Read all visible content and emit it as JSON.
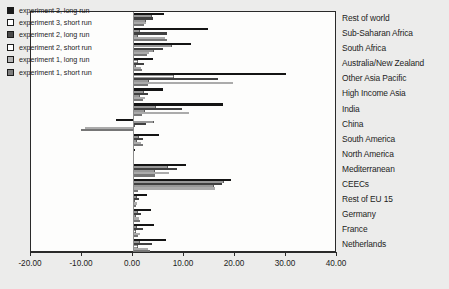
{
  "chart_data": {
    "type": "bar",
    "orientation": "horizontal",
    "title": "",
    "xlabel": "",
    "ylabel": "",
    "xlim": [
      -20.0,
      40.0
    ],
    "xticks": [
      -20.0,
      -10.0,
      0.0,
      10.0,
      20.0,
      30.0,
      40.0
    ],
    "xtick_labels": [
      "-20.00",
      "-10.00",
      "0.00",
      "10.00",
      "20.00",
      "30.00",
      "40.00"
    ],
    "grid": false,
    "legend_position": "top-left-inside",
    "categories": [
      "Rest of world",
      "Sub-Saharan Africa",
      "South Africa",
      "Australia/New Zealand",
      "Other Asia Pacific",
      "High Income Asia",
      "India",
      "China",
      "South America",
      "North America",
      "Mediterranean",
      "CEECs",
      "Rest of EU 15",
      "Germany",
      "France",
      "Netherlands"
    ],
    "series": [
      {
        "name": "experiment 3, long run",
        "color": "#141414",
        "values": [
          6.0,
          14.8,
          11.4,
          4.0,
          30.0,
          5.8,
          17.6,
          -3.4,
          5.0,
          0.4,
          10.4,
          19.2,
          2.8,
          3.6,
          4.1,
          6.5
        ]
      },
      {
        "name": "experiment 3, short run",
        "color": "#ffffff",
        "values": [
          3.8,
          1.4,
          7.6,
          0.9,
          8.0,
          2.1,
          4.6,
          4.2,
          1.2,
          0.2,
          6.9,
          17.8,
          0.7,
          1.0,
          0.8,
          1.4
        ]
      },
      {
        "name": "experiment 2, long run",
        "color": "#404040",
        "values": [
          3.9,
          6.6,
          5.8,
          2.2,
          16.6,
          2.9,
          9.6,
          2.5,
          1.9,
          0.1,
          8.6,
          17.4,
          1.1,
          1.5,
          2.0,
          3.8
        ]
      },
      {
        "name": "experiment 2, short run",
        "color": "#ffffff",
        "values": [
          2.6,
          1.0,
          4.1,
          0.5,
          3.1,
          1.4,
          2.4,
          0.4,
          0.8,
          0.1,
          4.3,
          15.9,
          0.4,
          0.6,
          0.5,
          0.9
        ]
      },
      {
        "name": "experiment 1, long run",
        "color": "#ababab",
        "values": [
          2.5,
          6.3,
          3.1,
          1.6,
          19.6,
          2.4,
          11.0,
          -9.4,
          1.6,
          0.1,
          7.0,
          16.0,
          0.8,
          1.1,
          1.3,
          3.0
        ]
      },
      {
        "name": "experiment 1, short run",
        "color": "#767676",
        "values": [
          2.2,
          6.6,
          2.7,
          1.8,
          3.0,
          2.0,
          1.8,
          -10.2,
          2.0,
          0.1,
          4.4,
          0.9,
          0.5,
          1.3,
          1.0,
          3.4
        ]
      }
    ]
  },
  "legend": {
    "items": [
      {
        "label": "experiment 3, long run",
        "swatch_class": "sw-e3long"
      },
      {
        "label": "experiment 3, short run",
        "swatch_class": "sw-e3short"
      },
      {
        "label": "experiment 2, long run",
        "swatch_class": "sw-e2long"
      },
      {
        "label": "experiment 2, short run",
        "swatch_class": "sw-e2short"
      },
      {
        "label": "experiment 1, long run",
        "swatch_class": "sw-e1long"
      },
      {
        "label": "experiment 1, short run",
        "swatch_class": "sw-e1short"
      }
    ]
  }
}
